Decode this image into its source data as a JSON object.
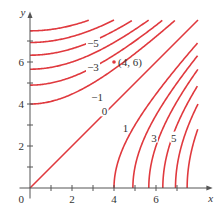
{
  "chart_data": {
    "type": "line",
    "title": "",
    "xlabel": "x",
    "ylabel": "y",
    "xlim": [
      0,
      8
    ],
    "ylim": [
      0,
      8
    ],
    "grid": false,
    "x_ticks": [
      1,
      2,
      3,
      4,
      5,
      6,
      7
    ],
    "x_tick_labels": [
      {
        "value": 2,
        "text": "2"
      },
      {
        "value": 4,
        "text": "4"
      },
      {
        "value": 6,
        "text": "6"
      }
    ],
    "y_ticks": [
      1,
      2,
      3,
      4,
      5,
      6,
      7
    ],
    "y_tick_labels": [
      {
        "value": 2,
        "text": "2"
      },
      {
        "value": 4,
        "text": "4"
      },
      {
        "value": 6,
        "text": "6"
      }
    ],
    "origin_label": "0",
    "curve_color": "#e0393e",
    "series": [
      {
        "name": "-7",
        "c": -64,
        "label": ""
      },
      {
        "name": "-6",
        "c": -56,
        "label": ""
      },
      {
        "name": "-5",
        "c": -48,
        "label": "−5",
        "label_at": [
          3.0,
          6.9
        ]
      },
      {
        "name": "-4",
        "c": -40,
        "label": ""
      },
      {
        "name": "-3",
        "c": -32,
        "label": "−3",
        "label_at": [
          3.0,
          5.75
        ]
      },
      {
        "name": "-2",
        "c": -24,
        "label": ""
      },
      {
        "name": "-1",
        "c": -16,
        "label": "−1",
        "label_at": [
          3.2,
          4.35
        ]
      },
      {
        "name": "0",
        "c": 0,
        "label": "0",
        "label_at": [
          3.55,
          3.65
        ]
      },
      {
        "name": "1",
        "c": 16,
        "label": "1",
        "label_at": [
          4.55,
          2.85
        ]
      },
      {
        "name": "2",
        "c": 24,
        "label": ""
      },
      {
        "name": "3",
        "c": 32,
        "label": "3",
        "label_at": [
          5.9,
          2.4
        ]
      },
      {
        "name": "4",
        "c": 40,
        "label": ""
      },
      {
        "name": "5",
        "c": 48,
        "label": "5",
        "label_at": [
          6.85,
          2.4
        ]
      },
      {
        "name": "6",
        "c": 56,
        "label": ""
      },
      {
        "name": "7",
        "c": 64,
        "label": ""
      }
    ],
    "annotations": [
      {
        "text": "(4, 6)",
        "point": [
          4,
          6
        ],
        "marker_color": "#e0393e"
      }
    ]
  }
}
